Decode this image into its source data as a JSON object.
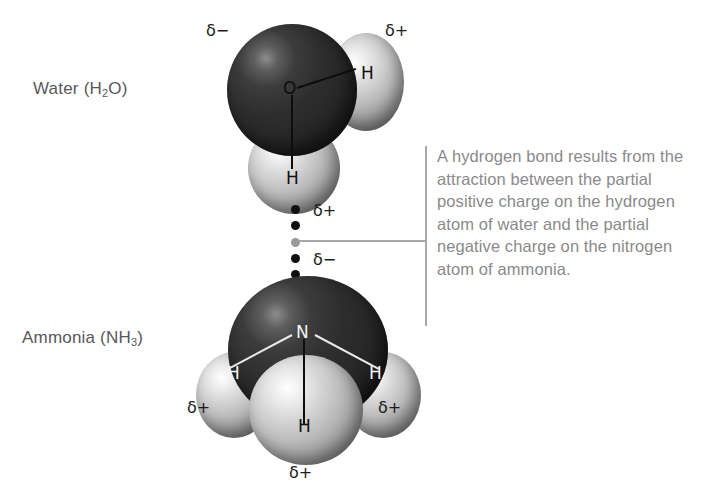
{
  "figure": {
    "background_color": "#ffffff",
    "caption": {
      "text": "A hydrogen bond results from the attraction between the partial positive charge on the hydrogen atom of water and the partial negative charge on the nitrogen atom of ammonia.",
      "color": "#8a8a8a",
      "rule_color": "#a8a8a8"
    }
  },
  "molecules": {
    "water": {
      "label": "Water (H",
      "label_sub": "2",
      "label_tail": "O)",
      "atoms": {
        "oxygen_letter": "O",
        "hydrogen_right_letter": "H",
        "hydrogen_bottom_letter": "H"
      },
      "charges": {
        "oxygen": "δ−",
        "hydrogen_right": "δ+",
        "hydrogen_bottom": "δ+"
      },
      "colors": {
        "oxygen": "#2b2b2b",
        "hydrogen": "#c9c9c9"
      }
    },
    "ammonia": {
      "label": "Ammonia (NH",
      "label_sub": "3",
      "label_tail": ")",
      "atoms": {
        "nitrogen_letter": "N",
        "hydrogen_left_letter": "H",
        "hydrogen_right_letter": "H",
        "hydrogen_front_letter": "H"
      },
      "charges": {
        "nitrogen": "δ−",
        "hydrogen_left": "δ+",
        "hydrogen_right": "δ+",
        "hydrogen_front": "δ+"
      },
      "colors": {
        "nitrogen": "#2b2b2b",
        "hydrogen": "#c9c9c9"
      }
    }
  },
  "hydrogen_bond": {
    "dot_count": 5,
    "dot_color": "#0f0f0f",
    "anchor_color": "#9a9a9a"
  }
}
